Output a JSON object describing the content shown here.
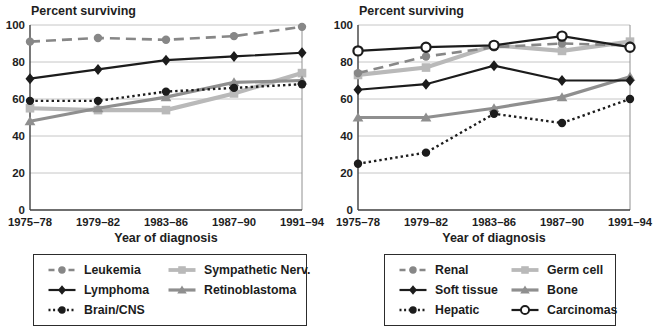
{
  "colors": {
    "black": "#1c1c1c",
    "gray": "#878787",
    "light_gray": "#b9b9b9",
    "mid_gray": "#8f8f8f",
    "grid": "#c6c6c6",
    "axis": "#3f3f3f",
    "plot_border": "#909090",
    "text": "#1e1e1e",
    "marker_open_fill": "#ffffff",
    "background": "#ffffff"
  },
  "chart_data": [
    {
      "type": "line",
      "title": "Percent surviving",
      "ylabel": "Percent surviving",
      "xlabel": "Year of diagnosis",
      "ylim": [
        0,
        100
      ],
      "y_ticks": [
        0,
        20,
        40,
        60,
        80,
        100
      ],
      "grid": "horizontal",
      "legend_position": "bottom-boxed",
      "categories": [
        "1975–78",
        "1979–82",
        "1983–86",
        "1987–90",
        "1991–94"
      ],
      "series": [
        {
          "name": "Leukemia",
          "values": [
            91,
            93,
            92,
            94,
            99
          ],
          "color_key": "gray",
          "dash": "dashed",
          "marker": "circle",
          "width": 2.6,
          "z": 3
        },
        {
          "name": "Lymphoma",
          "values": [
            71,
            76,
            81,
            83,
            85
          ],
          "color_key": "black",
          "dash": "solid",
          "marker": "diamond",
          "width": 2.2,
          "z": 4
        },
        {
          "name": "Brain/CNS",
          "values": [
            59,
            59,
            64,
            66,
            68
          ],
          "color_key": "black",
          "dash": "dotted",
          "marker": "circle",
          "width": 2.4,
          "z": 5
        },
        {
          "name": "Sympathetic Nerv.",
          "values": [
            55,
            54,
            54,
            63,
            74
          ],
          "color_key": "light_gray",
          "dash": "solid",
          "marker": "square",
          "width": 4.2,
          "z": 1
        },
        {
          "name": "Retinoblastoma",
          "values": [
            48,
            55,
            61,
            69,
            70
          ],
          "color_key": "mid_gray",
          "dash": "solid",
          "marker": "triangle",
          "width": 3.2,
          "z": 2
        }
      ],
      "legend_columns": [
        [
          "Leukemia",
          "Lymphoma",
          "Brain/CNS"
        ],
        [
          "Sympathetic Nerv.",
          "Retinoblastoma"
        ]
      ]
    },
    {
      "type": "line",
      "title": "Percent surviving",
      "ylabel": "Percent surviving",
      "xlabel": "Year of diagnosis",
      "ylim": [
        0,
        100
      ],
      "y_ticks": [
        0,
        20,
        40,
        60,
        80,
        100
      ],
      "grid": "horizontal",
      "legend_position": "bottom-boxed",
      "categories": [
        "1975–78",
        "1979–82",
        "1983–86",
        "1987–90",
        "1991–94"
      ],
      "series": [
        {
          "name": "Renal",
          "values": [
            74,
            83,
            88,
            90,
            89
          ],
          "color_key": "gray",
          "dash": "dashed",
          "marker": "circle",
          "width": 2.6,
          "z": 3
        },
        {
          "name": "Soft tissue",
          "values": [
            65,
            68,
            78,
            70,
            70
          ],
          "color_key": "black",
          "dash": "solid",
          "marker": "diamond",
          "width": 2.2,
          "z": 4
        },
        {
          "name": "Hepatic",
          "values": [
            25,
            31,
            52,
            47,
            60
          ],
          "color_key": "black",
          "dash": "dotted",
          "marker": "circle",
          "width": 2.4,
          "z": 5
        },
        {
          "name": "Germ cell",
          "values": [
            73,
            77,
            89,
            86,
            91
          ],
          "color_key": "light_gray",
          "dash": "solid",
          "marker": "square",
          "width": 4.2,
          "z": 1
        },
        {
          "name": "Bone",
          "values": [
            50,
            50,
            55,
            61,
            72
          ],
          "color_key": "mid_gray",
          "dash": "solid",
          "marker": "triangle",
          "width": 3.2,
          "z": 2
        },
        {
          "name": "Carcinomas",
          "values": [
            86,
            88,
            89,
            94,
            88
          ],
          "color_key": "black",
          "dash": "solid",
          "marker": "open-circle",
          "width": 2.2,
          "z": 6
        }
      ],
      "legend_columns": [
        [
          "Renal",
          "Soft tissue",
          "Hepatic"
        ],
        [
          "Germ cell",
          "Bone",
          "Carcinomas"
        ]
      ]
    }
  ]
}
